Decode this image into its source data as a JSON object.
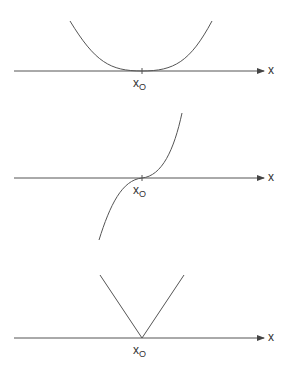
{
  "panels": [
    {
      "name": "flat-minimum",
      "axis_label": "x",
      "point_label": "x",
      "point_sub": "O",
      "curve": "quartic (x - x0)^4, tangent to axis at x0"
    },
    {
      "name": "inflection",
      "axis_label": "x",
      "point_label": "x",
      "point_sub": "O",
      "curve": "cubic (x - x0)^3, horizontal inflection at x0"
    },
    {
      "name": "corner",
      "axis_label": "x",
      "point_label": "x",
      "point_sub": "O",
      "curve": "absolute value |x - x0|, corner at x0"
    }
  ],
  "colors": {
    "line": "#555555",
    "text": "#333333"
  }
}
